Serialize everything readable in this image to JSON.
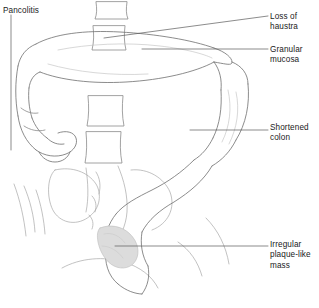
{
  "figure": {
    "name": "pancolitis-barium-enema-illustration",
    "background_color": "#ffffff",
    "line_color": "#6e6e6e",
    "text_color": "#1a1a1a",
    "shading_color": "#d8d8d8"
  },
  "labels": [
    {
      "id": "pancolitis",
      "text": "Pancolitis",
      "side": "left",
      "leader": "vertical"
    },
    {
      "id": "loss-of-haustra",
      "text": "Loss of\nhaustra",
      "side": "right",
      "leader": "slanted"
    },
    {
      "id": "granular-mucosa",
      "text": "Granular\nmucosa",
      "side": "right",
      "leader": "horizontal"
    },
    {
      "id": "shortened-colon",
      "text": "Shortened\ncolon",
      "side": "right",
      "leader": "horizontal"
    },
    {
      "id": "irregular-plaque-like-mass",
      "text": "Irregular\nplaque-like\nmass",
      "side": "right",
      "leader": "horizontal"
    }
  ],
  "anatomy": [
    {
      "id": "transverse-colon",
      "label": "transverse colon"
    },
    {
      "id": "hepatic-flexure",
      "label": "hepatic flexure"
    },
    {
      "id": "ascending-colon",
      "label": "ascending colon"
    },
    {
      "id": "cecum",
      "label": "cecum"
    },
    {
      "id": "splenic-flexure",
      "label": "splenic flexure"
    },
    {
      "id": "descending-colon",
      "label": "descending colon"
    },
    {
      "id": "sigmoid-colon",
      "label": "sigmoid colon"
    },
    {
      "id": "rectum",
      "label": "rectum"
    },
    {
      "id": "lumbar-vertebrae",
      "label": "lumbar vertebral bodies"
    },
    {
      "id": "sacrum",
      "label": "sacrum"
    },
    {
      "id": "pelvic-brim",
      "label": "pelvic bones"
    },
    {
      "id": "plaque-mass-shading",
      "label": "irregular plaque-like mass shading"
    }
  ]
}
